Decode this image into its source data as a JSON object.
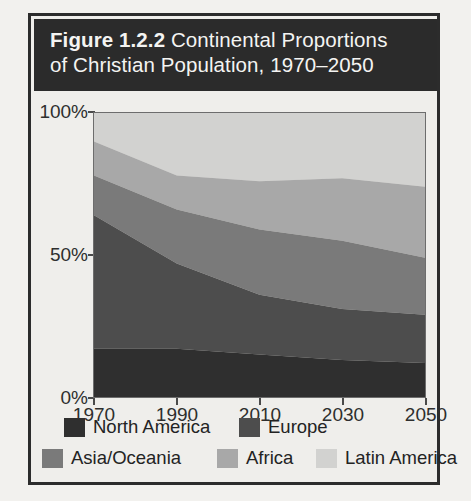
{
  "figure": {
    "title_prefix": "Figure 1.2.2",
    "title_rest": " Continental Proportions",
    "title_line2": "of Christian Population, 1970–2050"
  },
  "axes": {
    "y_ticks": [
      "100%",
      "50%",
      "0%"
    ],
    "x_ticks": [
      "1970",
      "1990",
      "2010",
      "2030",
      "2050"
    ]
  },
  "legend": {
    "items": [
      {
        "label": "North America",
        "color": "#2f2f2f"
      },
      {
        "label": "Europe",
        "color": "#4d4d4d"
      },
      {
        "label": "Asia/Oceania",
        "color": "#7a7a7a"
      },
      {
        "label": "Africa",
        "color": "#a8a8a8"
      },
      {
        "label": "Latin America",
        "color": "#d2d2d0"
      }
    ]
  },
  "chart_data": {
    "type": "area",
    "title": "Figure 1.2.2 Continental Proportions of Christian Population, 1970–2050",
    "xlabel": "",
    "ylabel": "",
    "stacked": true,
    "normalized": true,
    "grid": false,
    "legend_position": "bottom",
    "x": [
      1970,
      1990,
      2010,
      2030,
      2050
    ],
    "xlim": [
      1970,
      2050
    ],
    "ylim": [
      0,
      100
    ],
    "y_tick_values": [
      0,
      50,
      100
    ],
    "y_tick_labels": [
      "0%",
      "50%",
      "100%"
    ],
    "series": [
      {
        "name": "North America",
        "color": "#2f2f2f",
        "values": [
          17,
          17,
          15,
          13,
          12
        ]
      },
      {
        "name": "Europe",
        "color": "#4d4d4d",
        "values": [
          47,
          30,
          21,
          18,
          17
        ]
      },
      {
        "name": "Asia/Oceania",
        "color": "#7a7a7a",
        "values": [
          14,
          19,
          23,
          24,
          20
        ]
      },
      {
        "name": "Africa",
        "color": "#a8a8a8",
        "values": [
          12,
          12,
          17,
          22,
          25
        ]
      },
      {
        "name": "Latin America",
        "color": "#d2d2d0",
        "values": [
          10,
          22,
          24,
          23,
          26
        ]
      }
    ],
    "cumulative_tops": {
      "North America": [
        17,
        17,
        15,
        13,
        12
      ],
      "Europe": [
        64,
        47,
        36,
        31,
        29
      ],
      "Asia/Oceania": [
        78,
        66,
        59,
        55,
        49
      ],
      "Africa": [
        90,
        78,
        76,
        77,
        74
      ],
      "Latin America": [
        100,
        100,
        100,
        100,
        100
      ]
    }
  }
}
